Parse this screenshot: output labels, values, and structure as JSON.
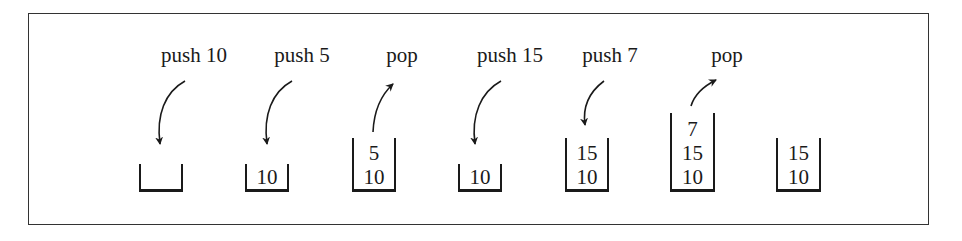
{
  "diagram": {
    "title": "",
    "operations": [
      {
        "label": "push 10",
        "type": "push",
        "stack_after": []
      },
      {
        "label": "push 5",
        "type": "push",
        "stack_after": [
          "10"
        ]
      },
      {
        "label": "pop",
        "type": "pop",
        "stack_after": [
          "5",
          "10"
        ]
      },
      {
        "label": "push 15",
        "type": "push",
        "stack_after": [
          "10"
        ]
      },
      {
        "label": "push 7",
        "type": "push",
        "stack_after": [
          "15",
          "10"
        ]
      },
      {
        "label": "pop",
        "type": "pop",
        "stack_after": [
          "7",
          "15",
          "10"
        ]
      }
    ],
    "stacks": [
      {
        "items": []
      },
      {
        "items": [
          "10"
        ]
      },
      {
        "items": [
          "5",
          "10"
        ]
      },
      {
        "items": [
          "10"
        ]
      },
      {
        "items": [
          "15",
          "10"
        ]
      },
      {
        "items": [
          "7",
          "15",
          "10"
        ]
      },
      {
        "items": [
          "15",
          "10"
        ]
      }
    ]
  }
}
